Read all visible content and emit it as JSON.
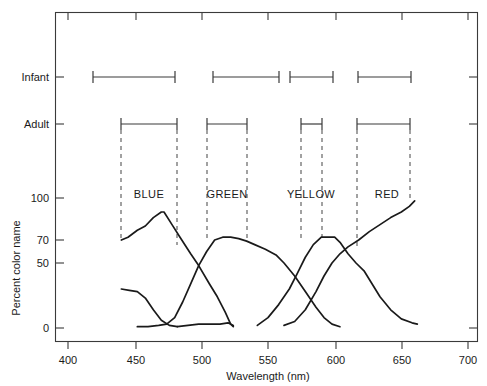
{
  "chart_data": {
    "type": "line",
    "title": "",
    "xlabel": "Wavelength (nm)",
    "ylabel": "Percent color name",
    "xlim": [
      385,
      707
    ],
    "ylim": [
      0,
      100
    ],
    "grid": false,
    "legend_position": "none",
    "x_ticks": [
      400,
      450,
      500,
      550,
      600,
      650,
      700
    ],
    "x_tick_labels": [
      "400",
      "450",
      "500",
      "550",
      "600",
      "650",
      "700"
    ],
    "y_ticks": [
      0,
      50,
      70,
      100
    ],
    "y_tick_labels": [
      "0",
      "50",
      "70",
      "100"
    ],
    "y_axis_note": "Non-linear percent axis: 0, 50, 70, 100 unevenly spaced",
    "row_labels": [
      "Infant",
      "Adult"
    ],
    "band_labels": [
      "BLUE",
      "GREEN",
      "YELLOW",
      "RED"
    ],
    "band_label_centers_nm": [
      462,
      520,
      582,
      637
    ],
    "range_bars": {
      "Infant": [
        {
          "band": "BLUE",
          "start_nm": 420,
          "end_nm": 482
        },
        {
          "band": "GREEN",
          "start_nm": 508,
          "end_nm": 558
        },
        {
          "band": "YELLOW",
          "start_nm": 566,
          "end_nm": 598
        },
        {
          "band": "RED",
          "start_nm": 585,
          "end_nm": 700
        }
      ],
      "Adult": [
        {
          "band": "BLUE",
          "start_nm": 441,
          "end_nm": 483
        },
        {
          "band": "GREEN",
          "start_nm": 506,
          "end_nm": 536
        },
        {
          "band": "YELLOW",
          "start_nm": 577,
          "end_nm": 593
        },
        {
          "band": "RED",
          "start_nm": 620,
          "end_nm": 660
        }
      ]
    },
    "infant_bar_px": [
      {
        "x1": 93,
        "x2": 175
      },
      {
        "x1": 213,
        "x2": 279
      },
      {
        "x1": 290,
        "x2": 333
      },
      {
        "x1": 358,
        "x2": 411
      }
    ],
    "adult_bar_px": [
      {
        "x1": 121,
        "x2": 177
      },
      {
        "x1": 207,
        "x2": 247
      },
      {
        "x1": 301,
        "x2": 322
      },
      {
        "x1": 357,
        "x2": 410
      }
    ],
    "dashed_guides_nm": [
      441,
      483,
      506,
      536,
      577,
      593,
      620,
      660
    ],
    "series": [
      {
        "name": "BLUE",
        "points": [
          [
            440,
            70
          ],
          [
            445,
            72
          ],
          [
            452,
            77
          ],
          [
            458,
            80
          ],
          [
            464,
            86
          ],
          [
            470,
            90
          ],
          [
            472,
            90
          ],
          [
            478,
            81
          ],
          [
            484,
            72
          ],
          [
            492,
            58
          ],
          [
            498,
            48
          ],
          [
            506,
            34
          ],
          [
            512,
            24
          ],
          [
            518,
            12
          ],
          [
            522,
            3
          ],
          [
            524,
            1
          ]
        ]
      },
      {
        "name": "GREEN",
        "points": [
          [
            452,
            1
          ],
          [
            460,
            1
          ],
          [
            468,
            2
          ],
          [
            474,
            3
          ],
          [
            480,
            8
          ],
          [
            486,
            20
          ],
          [
            492,
            34
          ],
          [
            498,
            48
          ],
          [
            504,
            60
          ],
          [
            510,
            70
          ],
          [
            516,
            72
          ],
          [
            522,
            72
          ],
          [
            528,
            71
          ],
          [
            534,
            69
          ],
          [
            540,
            66
          ],
          [
            548,
            62
          ],
          [
            556,
            57
          ],
          [
            562,
            50
          ],
          [
            570,
            40
          ],
          [
            578,
            28
          ],
          [
            586,
            16
          ],
          [
            592,
            8
          ],
          [
            598,
            3
          ],
          [
            604,
            1
          ]
        ]
      },
      {
        "name": "YELLOW-LEFT-TAIL",
        "points": [
          [
            440,
            30
          ],
          [
            446,
            29
          ],
          [
            452,
            28
          ],
          [
            458,
            23
          ],
          [
            464,
            14
          ],
          [
            470,
            6
          ],
          [
            476,
            2
          ],
          [
            482,
            1
          ]
        ]
      },
      {
        "name": "YELLOW",
        "points": [
          [
            482,
            1
          ],
          [
            490,
            2
          ],
          [
            498,
            3
          ],
          [
            506,
            3
          ],
          [
            514,
            3
          ],
          [
            520,
            4
          ],
          [
            524,
            2
          ]
        ]
      },
      {
        "name": "RED-RISE",
        "points": [
          [
            542,
            2
          ],
          [
            550,
            8
          ],
          [
            558,
            18
          ],
          [
            566,
            30
          ],
          [
            572,
            42
          ],
          [
            578,
            55
          ],
          [
            584,
            66
          ],
          [
            590,
            72
          ],
          [
            596,
            72
          ],
          [
            600,
            72
          ],
          [
            604,
            68
          ],
          [
            610,
            58
          ],
          [
            616,
            50
          ],
          [
            622,
            44
          ],
          [
            628,
            34
          ],
          [
            634,
            24
          ],
          [
            642,
            14
          ],
          [
            650,
            7
          ],
          [
            658,
            4
          ],
          [
            662,
            3
          ]
        ]
      },
      {
        "name": "RED",
        "points": [
          [
            562,
            2
          ],
          [
            570,
            5
          ],
          [
            578,
            14
          ],
          [
            586,
            28
          ],
          [
            592,
            40
          ],
          [
            598,
            50
          ],
          [
            604,
            58
          ],
          [
            610,
            64
          ],
          [
            618,
            70
          ],
          [
            626,
            76
          ],
          [
            634,
            81
          ],
          [
            642,
            86
          ],
          [
            650,
            90
          ],
          [
            656,
            94
          ],
          [
            660,
            98
          ]
        ]
      }
    ]
  },
  "axes": {
    "x_title": "Wavelength (nm)",
    "y_title": "Percent color name"
  },
  "rows": {
    "infant": "Infant",
    "adult": "Adult"
  },
  "bands": {
    "blue": "BLUE",
    "green": "GREEN",
    "yellow": "YELLOW",
    "red": "RED"
  },
  "ticks": {
    "x": [
      "400",
      "450",
      "500",
      "550",
      "600",
      "650",
      "700"
    ],
    "y": [
      "100",
      "70",
      "50",
      "0"
    ]
  },
  "colors": {
    "ink": "#1a1a1a",
    "axis": "#3a3a3a",
    "dash": "#555555",
    "background": "#ffffff"
  }
}
